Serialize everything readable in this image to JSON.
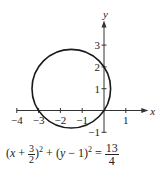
{
  "chart_data": {
    "type": "line",
    "title": "",
    "xlabel": "x",
    "ylabel": "y",
    "xlim": [
      -4,
      1.5
    ],
    "ylim": [
      -1,
      3.5
    ],
    "x_ticks": [
      -4,
      -3,
      -2,
      -1,
      1
    ],
    "x_tick_labels": [
      "−4",
      "−3",
      "−2",
      "−1",
      "1"
    ],
    "y_ticks": [
      -1,
      1,
      2,
      3
    ],
    "y_tick_labels": [
      "−1",
      "1",
      "2",
      "3"
    ],
    "grid": false,
    "legend": "none",
    "series": [
      {
        "name": "circle",
        "shape": "circle",
        "center": [
          -1.5,
          1
        ],
        "radius_squared": 3.25,
        "color": "#1a1a1a"
      }
    ],
    "annotation": {
      "equation_parts": {
        "open": "(",
        "x": "x",
        "plus": " + ",
        "frac_num": "3",
        "frac_den": "2",
        "close1": ")",
        "exp1": "2",
        "plus2": " + (",
        "y": "y",
        "minus": " − 1)",
        "exp2": "2",
        "equals": " = ",
        "rhs_num": "13",
        "rhs_den": "4"
      },
      "text": "(x + 3/2)² + (y − 1)² = 13/4"
    }
  }
}
